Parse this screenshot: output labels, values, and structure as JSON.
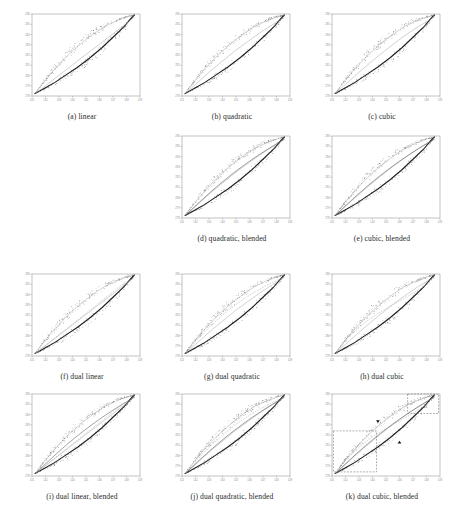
{
  "figure": {
    "title": "",
    "columns": 3,
    "rows": 4,
    "background": "#ffffff",
    "ink_color": "#1d1d1d"
  },
  "chart_data": {
    "type": "scatter",
    "title": "",
    "xlabel": "",
    "ylabel": "",
    "xlim": [
      141,
      149
    ],
    "ylim": [
      278,
      286
    ],
    "xticks": [
      141,
      142,
      143,
      144,
      145,
      146,
      147,
      148,
      149
    ],
    "yticks": [
      278,
      279,
      280,
      281,
      282,
      283,
      284,
      285,
      286
    ],
    "grid": false,
    "legend": "none",
    "shared_axes": true,
    "series": [
      {
        "name": "measured-samples",
        "style": "scatter",
        "color": "#3b3b3b",
        "marker": "dot",
        "shape": "hysteresis-loop"
      },
      {
        "name": "fitted-curve",
        "style": "line",
        "color": "#555555"
      },
      {
        "name": "reference-curve",
        "style": "line-dashed",
        "color": "#9b9b9b"
      }
    ],
    "loop_upper_branch": {
      "x": [
        141.2,
        141.9,
        142.6,
        143.3,
        144.0,
        144.8,
        145.6,
        146.4,
        147.2,
        148.0,
        148.6
      ],
      "y": [
        278.2,
        279.4,
        280.5,
        281.5,
        282.4,
        283.3,
        284.1,
        284.8,
        285.3,
        285.7,
        285.9
      ]
    },
    "loop_lower_branch": {
      "x": [
        141.2,
        141.9,
        142.7,
        143.5,
        144.4,
        145.3,
        146.2,
        147.0,
        147.8,
        148.3,
        148.6
      ],
      "y": [
        278.2,
        278.7,
        279.3,
        280.0,
        280.8,
        281.7,
        282.7,
        283.7,
        284.7,
        285.5,
        285.9
      ]
    },
    "panels": [
      {
        "key": "a",
        "label": "(a) linear",
        "caption": "(a) linear",
        "model": "linear",
        "blended": false,
        "dual": false,
        "roi_boxes": 0,
        "arrow_markers": 0
      },
      {
        "key": "b",
        "label": "(b) quadratic",
        "caption": "(b) quadratic",
        "model": "quadratic",
        "blended": false,
        "dual": false,
        "roi_boxes": 0,
        "arrow_markers": 0
      },
      {
        "key": "c",
        "label": "(c) cubic",
        "caption": "(c) cubic",
        "model": "cubic",
        "blended": false,
        "dual": false,
        "roi_boxes": 0,
        "arrow_markers": 0
      },
      {
        "key": "d",
        "label": "(d) quadratic, blended",
        "caption": "(d) quadratic, blended",
        "model": "quadratic",
        "blended": true,
        "dual": false,
        "roi_boxes": 0,
        "arrow_markers": 0
      },
      {
        "key": "e",
        "label": "(e) cubic, blended",
        "caption": "(e) cubic, blended",
        "model": "cubic",
        "blended": true,
        "dual": false,
        "roi_boxes": 0,
        "arrow_markers": 0
      },
      {
        "key": "f",
        "label": "(f) dual linear",
        "caption": "(f) dual linear",
        "model": "linear",
        "blended": false,
        "dual": true,
        "roi_boxes": 0,
        "arrow_markers": 0
      },
      {
        "key": "g",
        "label": "(g) dual quadratic",
        "caption": "(g) dual quadratic",
        "model": "quadratic",
        "blended": false,
        "dual": true,
        "roi_boxes": 0,
        "arrow_markers": 0
      },
      {
        "key": "h",
        "label": "(h) dual cubic",
        "caption": "(h) dual cubic",
        "model": "cubic",
        "blended": false,
        "dual": true,
        "roi_boxes": 0,
        "arrow_markers": 0
      },
      {
        "key": "i",
        "label": "(i) dual linear, blended",
        "caption": "(i) dual linear, blended",
        "model": "linear",
        "blended": true,
        "dual": true,
        "roi_boxes": 0,
        "arrow_markers": 0
      },
      {
        "key": "j",
        "label": "(j) dual quadratic, blended",
        "caption": "(j) dual quadratic, blended",
        "model": "quadratic",
        "blended": true,
        "dual": true,
        "roi_boxes": 0,
        "arrow_markers": 0
      },
      {
        "key": "k",
        "label": "(k) dual cubic, blended",
        "caption": "(k) dual cubic, blended",
        "model": "cubic",
        "blended": true,
        "dual": true,
        "roi_boxes": 2,
        "arrow_markers": 2
      }
    ]
  }
}
